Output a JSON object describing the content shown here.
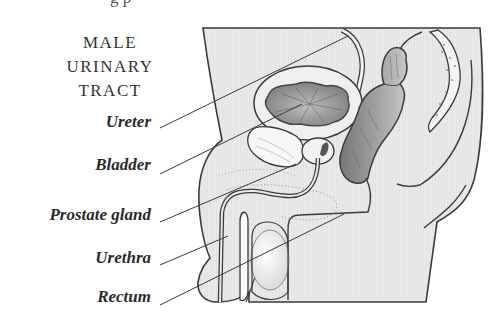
{
  "title_lines": [
    "MALE",
    "URINARY",
    "TRACT"
  ],
  "top_cut_text": "g        p",
  "labels": [
    {
      "text": "Ureter",
      "y": 112
    },
    {
      "text": "Bladder",
      "y": 155
    },
    {
      "text": "Prostate gland",
      "y": 205
    },
    {
      "text": "Urethra",
      "y": 248
    },
    {
      "text": "Rectum",
      "y": 287
    }
  ],
  "colors": {
    "body_fill": "#e8e8e8",
    "outline": "#3a3a3a",
    "organ_dark": "#8a8a8a",
    "text": "#2a2a2a"
  }
}
